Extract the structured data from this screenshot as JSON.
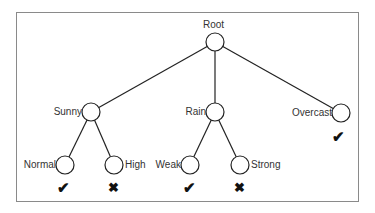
{
  "diagram": {
    "type": "decision-tree",
    "nodes": [
      {
        "id": "root",
        "label": "Root",
        "x": 215,
        "y": 42
      },
      {
        "id": "sunny",
        "label": "Sunny",
        "x": 91,
        "y": 112
      },
      {
        "id": "rain",
        "label": "Rain",
        "x": 215,
        "y": 112
      },
      {
        "id": "overcast",
        "label": "Overcast",
        "x": 341,
        "y": 113,
        "outcome": "check"
      },
      {
        "id": "normal",
        "label": "Normal",
        "x": 65,
        "y": 165,
        "outcome": "check"
      },
      {
        "id": "high",
        "label": "High",
        "x": 114,
        "y": 165,
        "outcome": "cross"
      },
      {
        "id": "weak",
        "label": "Weak",
        "x": 190,
        "y": 165,
        "outcome": "check"
      },
      {
        "id": "strong",
        "label": "Strong",
        "x": 240,
        "y": 165,
        "outcome": "cross"
      }
    ],
    "edges": [
      [
        "root",
        "sunny"
      ],
      [
        "root",
        "rain"
      ],
      [
        "root",
        "overcast"
      ],
      [
        "sunny",
        "normal"
      ],
      [
        "sunny",
        "high"
      ],
      [
        "rain",
        "weak"
      ],
      [
        "rain",
        "strong"
      ]
    ],
    "icons": {
      "check": "check-icon",
      "cross": "cross-icon"
    },
    "glyphs": {
      "check": "✔",
      "cross": "✖"
    },
    "colors": {
      "line": "#222222",
      "frame": "#8a8a8a",
      "text": "#333333"
    }
  }
}
